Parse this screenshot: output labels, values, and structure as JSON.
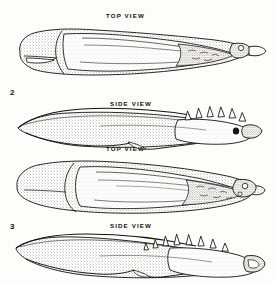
{
  "plate": {
    "kind": "scientific-illustration-plate",
    "background_color": "#fdfdfc",
    "ink_color": "#14100d",
    "width": 274,
    "height": 284
  },
  "figures": [
    {
      "number": "2",
      "number_position": {
        "x": 10,
        "y": 88
      },
      "views": [
        {
          "label": "TOP VIEW",
          "label_position": {
            "x": 106,
            "y": 12
          },
          "drawing": {
            "name": "figure-2-top-view",
            "description": "Elongated dorsal view of sclerotized structure, broad rounded base at left tapering to narrow pointed apex at right with stippled shading",
            "bounds": {
              "x": 14,
              "y": 26,
              "width": 248,
              "height": 50
            }
          }
        },
        {
          "label": "SIDE VIEW",
          "label_position": {
            "x": 110,
            "y": 100
          },
          "drawing": {
            "name": "figure-2-side-view",
            "description": "Lateral view, slender sickle-shaped shaft at left rising to a toothed crest bearing six recurved spines at right",
            "bounds": {
              "x": 14,
              "y": 108,
              "width": 248,
              "height": 42
            },
            "spine_count": 6
          }
        }
      ]
    },
    {
      "number": "3",
      "number_position": {
        "x": 10,
        "y": 222
      },
      "views": [
        {
          "label": "TOP VIEW",
          "label_position": {
            "x": 106,
            "y": 145
          },
          "drawing": {
            "name": "figure-3-top-view",
            "description": "Elongated dorsal view, wider rounded base at left, median longitudinal ridges, granular apical region at right",
            "bounds": {
              "x": 14,
              "y": 158,
              "width": 248,
              "height": 52
            }
          }
        },
        {
          "label": "SIDE VIEW",
          "label_position": {
            "x": 110,
            "y": 222
          },
          "drawing": {
            "name": "figure-3-side-view",
            "description": "Lateral view with sinuous lower margin and a dense row of eight recurved apical spines at right",
            "bounds": {
              "x": 14,
              "y": 232,
              "width": 248,
              "height": 46
            },
            "spine_count": 8
          }
        }
      ]
    }
  ]
}
